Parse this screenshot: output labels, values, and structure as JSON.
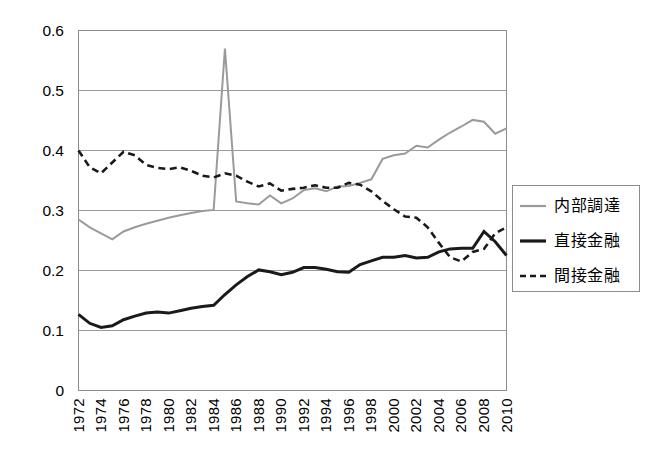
{
  "chart_data": {
    "type": "line",
    "title": "",
    "xlabel": "",
    "ylabel": "",
    "ylim": [
      0,
      0.6
    ],
    "xlim": [
      1972,
      2010
    ],
    "grid": true,
    "legend_position": "right",
    "y_ticks": [
      "0.6",
      "0.5",
      "0.4",
      "0.3",
      "0.2",
      "0.1",
      "0"
    ],
    "y_tick_values": [
      0.6,
      0.5,
      0.4,
      0.3,
      0.2,
      0.1,
      0
    ],
    "x_tick_labels": [
      "1972",
      "1974",
      "1976",
      "1978",
      "1980",
      "1982",
      "1984",
      "1986",
      "1988",
      "1990",
      "1992",
      "1994",
      "1996",
      "1998",
      "2000",
      "2002",
      "2004",
      "2006",
      "2008",
      "2010"
    ],
    "x": [
      1972,
      1973,
      1974,
      1975,
      1976,
      1977,
      1978,
      1979,
      1980,
      1981,
      1982,
      1983,
      1984,
      1985,
      1986,
      1987,
      1988,
      1989,
      1990,
      1991,
      1992,
      1993,
      1994,
      1995,
      1996,
      1997,
      1998,
      1999,
      2000,
      2001,
      2002,
      2003,
      2004,
      2005,
      2006,
      2007,
      2008,
      2009,
      2010
    ],
    "series": [
      {
        "name": "内部調達",
        "style": "solid",
        "color": "#9a9a9a",
        "width": 2,
        "values": [
          0.285,
          0.272,
          0.262,
          0.252,
          0.265,
          0.272,
          0.278,
          0.283,
          0.288,
          0.292,
          0.296,
          0.299,
          0.301,
          0.57,
          0.315,
          0.312,
          0.31,
          0.325,
          0.312,
          0.32,
          0.334,
          0.337,
          0.332,
          0.34,
          0.341,
          0.346,
          0.352,
          0.386,
          0.392,
          0.395,
          0.408,
          0.405,
          0.418,
          0.43,
          0.44,
          0.451,
          0.448,
          0.428,
          0.437
        ]
      },
      {
        "name": "直接金融",
        "style": "solid",
        "color": "#1a1a1a",
        "width": 3,
        "values": [
          0.127,
          0.112,
          0.105,
          0.108,
          0.118,
          0.124,
          0.129,
          0.131,
          0.129,
          0.133,
          0.137,
          0.14,
          0.142,
          0.16,
          0.176,
          0.19,
          0.201,
          0.198,
          0.193,
          0.197,
          0.205,
          0.205,
          0.202,
          0.198,
          0.197,
          0.21,
          0.216,
          0.222,
          0.222,
          0.225,
          0.221,
          0.222,
          0.231,
          0.236,
          0.237,
          0.237,
          0.265,
          0.248,
          0.225
        ]
      },
      {
        "name": "間接金融",
        "style": "dashed",
        "color": "#1a1a1a",
        "width": 2.6,
        "values": [
          0.4,
          0.372,
          0.362,
          0.38,
          0.398,
          0.392,
          0.376,
          0.371,
          0.369,
          0.372,
          0.366,
          0.358,
          0.355,
          0.362,
          0.358,
          0.348,
          0.34,
          0.345,
          0.333,
          0.336,
          0.338,
          0.342,
          0.338,
          0.338,
          0.346,
          0.343,
          0.332,
          0.316,
          0.302,
          0.29,
          0.288,
          0.272,
          0.246,
          0.222,
          0.215,
          0.231,
          0.236,
          0.262,
          0.272
        ]
      }
    ]
  },
  "legend": {
    "items": [
      {
        "label": "内部調達",
        "swatch": "solid-gray-line"
      },
      {
        "label": "直接金融",
        "swatch": "solid-black-line"
      },
      {
        "label": "間接金融",
        "swatch": "dashed-black-line"
      }
    ]
  },
  "colors": {
    "series_internal": "#9a9a9a",
    "series_direct": "#1a1a1a",
    "series_indirect": "#1a1a1a",
    "gridline": "#9a9a9a",
    "axis": "#8c8c8c",
    "background": "#ffffff"
  }
}
